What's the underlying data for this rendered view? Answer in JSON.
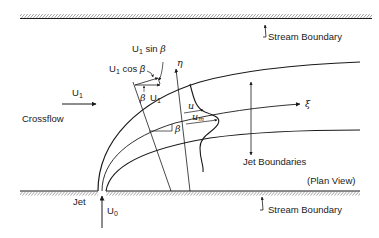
{
  "diagram": {
    "view_label": "(Plan View)",
    "labels": {
      "stream_boundary_top": "Stream Boundary",
      "stream_boundary_bottom": "Stream Boundary",
      "crossflow": "Crossflow",
      "crossflow_velocity": "U",
      "crossflow_velocity_sub": "1",
      "jet": "Jet",
      "jet_velocity": "U",
      "jet_velocity_sub": "0",
      "jet_boundaries": "Jet Boundaries",
      "u1_sin_beta_u": "U",
      "u1_sin_beta_sub": "1",
      "u1_sin_beta_rest": " sin ",
      "u1_cos_beta_u": "U",
      "u1_cos_beta_sub": "1",
      "u1_cos_beta_rest": " cos ",
      "beta": "β",
      "u1_vec_u": "U",
      "u1_vec_sub": "1",
      "eta": "η",
      "xi": "ξ",
      "u_local": "u",
      "u_max": "u",
      "u_max_sub": "m"
    },
    "colors": {
      "line": "#1a1a1a",
      "background": "#ffffff"
    }
  }
}
